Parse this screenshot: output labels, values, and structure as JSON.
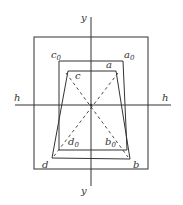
{
  "diagram": {
    "colors": {
      "line": "#333333",
      "background": "#ffffff"
    },
    "axes": {
      "horizontal": {
        "label_left": "h",
        "label_right": "h"
      },
      "vertical": {
        "label_top": "y",
        "label_bottom": "y"
      }
    },
    "outer_frame": {
      "x": 34,
      "y": 37,
      "w": 114,
      "h": 132
    },
    "original_rectangle": {
      "vertices": [
        {
          "name": "a0",
          "x": 123,
          "y": 61
        },
        {
          "name": "b0",
          "x": 127,
          "y": 150
        },
        {
          "name": "d0",
          "x": 59,
          "y": 150
        },
        {
          "name": "c0",
          "x": 59,
          "y": 61
        }
      ]
    },
    "distorted_quadrilateral": {
      "vertices": [
        {
          "name": "a",
          "x": 116,
          "y": 71
        },
        {
          "name": "b",
          "x": 130,
          "y": 159
        },
        {
          "name": "d",
          "x": 52,
          "y": 158
        },
        {
          "name": "c",
          "x": 68,
          "y": 71
        }
      ]
    },
    "labels": {
      "a0": "a",
      "a0_sub": "0",
      "b0": "b",
      "b0_sub": "0",
      "c0": "c",
      "c0_sub": "0",
      "d0": "d",
      "d0_sub": "0",
      "a": "a",
      "b": "b",
      "c": "c",
      "d": "d"
    }
  }
}
